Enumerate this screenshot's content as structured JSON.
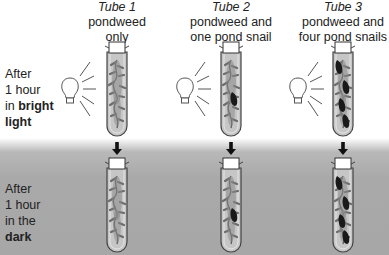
{
  "tubes": [
    {
      "title": "Tube 1",
      "line1": "pondweed",
      "line2": "only",
      "snails": 0
    },
    {
      "title": "Tube 2",
      "line1": "pondweed and",
      "line2": "one pond snail",
      "snails": 1
    },
    {
      "title": "Tube 3",
      "line1": "pondweed and",
      "line2": "four pond snails",
      "snails": 4
    }
  ],
  "rows": [
    {
      "line1": "After",
      "line2": "1 hour",
      "prefix": "in ",
      "bold": "bright",
      "line4_bold": "light"
    },
    {
      "line1": "After",
      "line2": "1 hour",
      "line3": "in the",
      "line4_bold": "dark"
    }
  ],
  "colors": {
    "dark_band": "#a9a9a9",
    "tube_fill": "#c4c4c4",
    "snail": "#1a1a1a",
    "weed": "#707070"
  },
  "icons": [
    "light-bulb-icon",
    "arrow-down-icon",
    "test-tube-icon",
    "pond-snail-icon",
    "pondweed-icon"
  ]
}
